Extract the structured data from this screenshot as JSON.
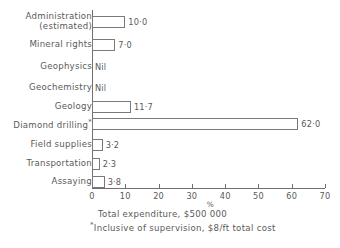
{
  "chart_data": {
    "type": "bar",
    "orientation": "horizontal",
    "title": "",
    "xlabel": "%",
    "ylabel": "",
    "xlim": [
      0,
      70
    ],
    "xticks": [
      0,
      10,
      20,
      30,
      40,
      50,
      60,
      70
    ],
    "xtick_labels": [
      "0",
      "10",
      "20",
      "30",
      "40",
      "50",
      "60",
      "70"
    ],
    "grid": false,
    "legend": null,
    "categories": [
      "Administration (estimated)",
      "Mineral rights",
      "Geophysics",
      "Geochemistry",
      "Geology",
      "Diamond drilling",
      "Field supplies",
      "Transportation",
      "Assaying"
    ],
    "values": [
      10.0,
      7.0,
      0,
      0,
      11.7,
      62.0,
      3.2,
      2.3,
      3.8
    ],
    "value_labels": [
      "10·0",
      "7·0",
      "Nil",
      "Nil",
      "11·7",
      "62·0",
      "3·2",
      "2·3",
      "3·8"
    ]
  },
  "rows": [
    {
      "label_line1": "Administration",
      "label_line2": "(estimated)",
      "two_line": true,
      "starred": false,
      "value": 10.0,
      "value_label": "10·0",
      "is_nil": false
    },
    {
      "label_line1": "Mineral rights",
      "label_line2": "",
      "two_line": false,
      "starred": false,
      "value": 7.0,
      "value_label": "7·0",
      "is_nil": false
    },
    {
      "label_line1": "Geophysics",
      "label_line2": "",
      "two_line": false,
      "starred": false,
      "value": 0,
      "value_label": "Nil",
      "is_nil": true
    },
    {
      "label_line1": "Geochemistry",
      "label_line2": "",
      "two_line": false,
      "starred": false,
      "value": 0,
      "value_label": "Nil",
      "is_nil": true
    },
    {
      "label_line1": "Geology",
      "label_line2": "",
      "two_line": false,
      "starred": false,
      "value": 11.7,
      "value_label": "11·7",
      "is_nil": false
    },
    {
      "label_line1": "Diamond drilling",
      "label_line2": "",
      "two_line": false,
      "starred": true,
      "value": 62.0,
      "value_label": "62·0",
      "is_nil": false
    },
    {
      "label_line1": "Field supplies",
      "label_line2": "",
      "two_line": false,
      "starred": false,
      "value": 3.2,
      "value_label": "3·2",
      "is_nil": false
    },
    {
      "label_line1": "Transportation",
      "label_line2": "",
      "two_line": false,
      "starred": false,
      "value": 2.3,
      "value_label": "2·3",
      "is_nil": false
    },
    {
      "label_line1": "Assaying",
      "label_line2": "",
      "two_line": false,
      "starred": false,
      "value": 3.8,
      "value_label": "3·8",
      "is_nil": false
    }
  ],
  "axis": {
    "unit_symbol": "%",
    "ticks": [
      "0",
      "10",
      "20",
      "30",
      "40",
      "50",
      "60",
      "70"
    ]
  },
  "captions": {
    "total": "Total expenditure, $500 000",
    "footnote": "Inclusive of supervision, $8/ft total cost",
    "footnote_marker": "*"
  },
  "colors": {
    "ink": "#5a5a5a",
    "rule": "#6f6f6f",
    "bar_outline": "#7a7a7a",
    "bar_fill": "#ffffff",
    "background": "#ffffff"
  }
}
